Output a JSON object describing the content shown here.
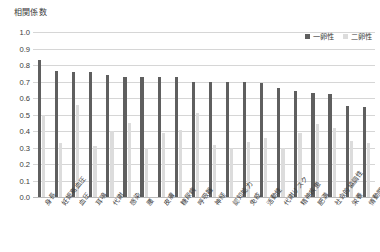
{
  "chart_data": {
    "type": "bar",
    "title": "",
    "ylabel": "相関係数",
    "xlabel": "",
    "ylim": [
      0,
      1.0
    ],
    "ytick_step": 0.1,
    "yticks": [
      "1.0",
      "0.9",
      "0.8",
      "0.7",
      "0.6",
      "0.5",
      "0.4",
      "0.3",
      "0.2",
      "0.1",
      "0.0"
    ],
    "grid": true,
    "legend_position": "top-right",
    "categories": [
      "身長",
      "妊娠高血圧",
      "血圧",
      "耳鳴",
      "代謝",
      "感染",
      "腰",
      "皮膚",
      "糖尿病",
      "呼吸器",
      "神経",
      "認知能力",
      "免疫",
      "活動性",
      "代謝リスク",
      "精神疾患",
      "肥満",
      "社会的協調性",
      "栄養",
      "情動関係"
    ],
    "series": [
      {
        "name": "一卵性",
        "color": "#5f5f5f",
        "values": [
          0.83,
          0.765,
          0.76,
          0.755,
          0.74,
          0.73,
          0.73,
          0.73,
          0.725,
          0.7,
          0.695,
          0.695,
          0.695,
          0.69,
          0.66,
          0.645,
          0.63,
          0.625,
          0.55,
          0.545
        ]
      },
      {
        "name": "二卵性",
        "color": "#dcdcdc",
        "values": [
          0.5,
          0.325,
          0.555,
          0.31,
          0.4,
          0.45,
          0.3,
          0.39,
          0.405,
          0.51,
          0.315,
          0.3,
          0.335,
          0.36,
          0.295,
          0.39,
          0.44,
          0.42,
          0.34,
          0.33
        ]
      }
    ]
  },
  "legend": {
    "items": [
      {
        "label": "一卵性"
      },
      {
        "label": "二卵性"
      }
    ]
  }
}
